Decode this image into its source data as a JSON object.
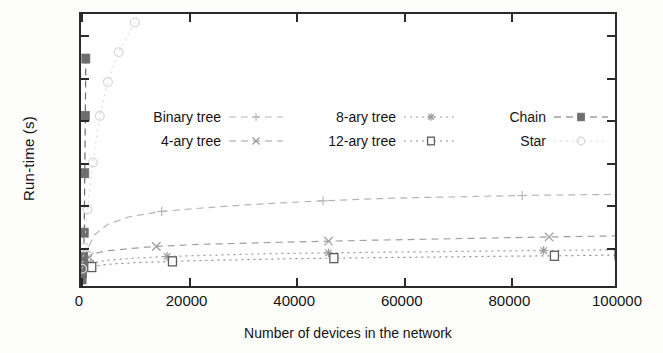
{
  "chart_data": {
    "type": "line",
    "title": "",
    "xlabel": "Number of devices in the network",
    "ylabel": "Run-time (s)",
    "xlim": [
      0,
      100000
    ],
    "ylim": [
      0,
      1.3
    ],
    "xticks": [
      0,
      20000,
      40000,
      60000,
      80000,
      100000
    ],
    "xticklabels": [
      "0",
      "20000",
      "40000",
      "60000",
      "80000",
      "100000"
    ],
    "yticks": [
      0,
      0.2,
      0.4,
      0.6,
      0.8,
      1,
      1.2
    ],
    "yticklabels": [
      "0",
      "0.2",
      "0.4",
      "0.6",
      "0.8",
      "1",
      "1.2"
    ],
    "grid": false,
    "legend_position": "upper-center-inside",
    "legend_columns": 3,
    "series": [
      {
        "name": "Binary tree",
        "marker": "plus",
        "linestyle": "dashed",
        "color": "#b6b6b6",
        "x": [
          100,
          400,
          1000,
          2500,
          5000,
          9000,
          15000,
          22000,
          30000,
          37000,
          45000,
          55000,
          62000,
          72000,
          82000,
          90000,
          100000
        ],
        "y": [
          0.1,
          0.13,
          0.18,
          0.26,
          0.31,
          0.345,
          0.37,
          0.385,
          0.4,
          0.41,
          0.42,
          0.43,
          0.435,
          0.44,
          0.445,
          0.448,
          0.45
        ]
      },
      {
        "name": "4-ary tree",
        "marker": "x",
        "linestyle": "dashed",
        "color": "#a0a0a0",
        "x": [
          100,
          500,
          1500,
          3000,
          5000,
          9000,
          14000,
          22000,
          30000,
          37000,
          46000,
          55000,
          62000,
          72000,
          87000,
          100000
        ],
        "y": [
          0.09,
          0.12,
          0.155,
          0.175,
          0.185,
          0.195,
          0.205,
          0.215,
          0.22,
          0.225,
          0.23,
          0.235,
          0.238,
          0.243,
          0.25,
          0.255
        ]
      },
      {
        "name": "8-ary tree",
        "marker": "star",
        "linestyle": "dotted",
        "color": "#9a9a9a",
        "x": [
          100,
          600,
          1800,
          3500,
          5000,
          10000,
          16000,
          23000,
          30000,
          37000,
          46000,
          56000,
          64000,
          74000,
          86000,
          100000
        ],
        "y": [
          0.085,
          0.105,
          0.125,
          0.135,
          0.14,
          0.15,
          0.158,
          0.163,
          0.168,
          0.172,
          0.175,
          0.178,
          0.18,
          0.183,
          0.186,
          0.19
        ]
      },
      {
        "name": "12-ary tree",
        "marker": "square-open",
        "linestyle": "dotted",
        "color": "#8e8e8e",
        "x": [
          100,
          700,
          2000,
          4000,
          6000,
          11000,
          17000,
          22500,
          31000,
          38000,
          47000,
          57000,
          65000,
          75000,
          88000,
          100000
        ],
        "y": [
          0.08,
          0.095,
          0.108,
          0.118,
          0.123,
          0.13,
          0.135,
          0.139,
          0.143,
          0.147,
          0.15,
          0.153,
          0.155,
          0.158,
          0.161,
          0.165
        ]
      },
      {
        "name": "Chain",
        "marker": "square-filled",
        "linestyle": "dashed",
        "color": "#6e6e6e",
        "x": [
          200,
          300,
          400,
          500,
          600,
          700,
          800,
          900
        ],
        "y": [
          0.05,
          0.08,
          0.12,
          0.155,
          0.27,
          0.55,
          0.82,
          1.09
        ]
      },
      {
        "name": "Star",
        "marker": "circle-open",
        "linestyle": "dotted",
        "color": "#d8d8d8",
        "x": [
          200,
          600,
          1200,
          2200,
          3500,
          5000,
          7000,
          10000
        ],
        "y": [
          0.1,
          0.2,
          0.38,
          0.6,
          0.82,
          0.98,
          1.12,
          1.26
        ]
      }
    ],
    "legend_entries": [
      {
        "label": "Binary tree",
        "marker": "plus"
      },
      {
        "label": "8-ary tree",
        "marker": "star"
      },
      {
        "label": "Chain",
        "marker": "square-filled"
      },
      {
        "label": "4-ary tree",
        "marker": "x"
      },
      {
        "label": "12-ary tree",
        "marker": "square-open"
      },
      {
        "label": "Star",
        "marker": "circle-open"
      }
    ]
  }
}
